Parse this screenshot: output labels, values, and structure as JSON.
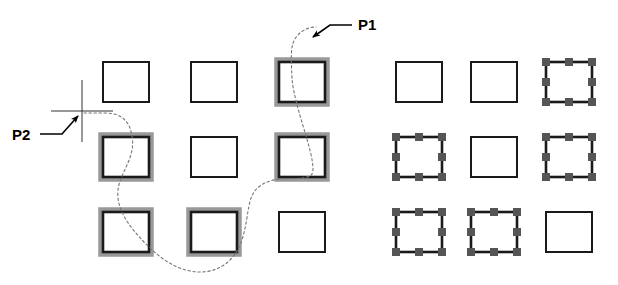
{
  "figure": {
    "background_color": "#ffffff",
    "width": 618,
    "height": 285
  },
  "colors": {
    "outline": "#1a1a1a",
    "highlight_halo": "#999999",
    "grip": "#555555",
    "lasso": "#777777",
    "crosshair": "#333333",
    "leader": "#000000",
    "label": "#000000"
  },
  "labels": [
    {
      "id": "p1",
      "text": "P1",
      "x": 358,
      "y": 30,
      "description": "end point of free-form selection path"
    },
    {
      "id": "p2",
      "text": "P2",
      "x": 12,
      "y": 140,
      "description": "start point of free-form selection path at crosshair cursor"
    }
  ],
  "geometry": {
    "square_width": 46,
    "square_height": 40,
    "left_group": {
      "name": "before-selection",
      "origin_x": 103,
      "origin_y": 62,
      "col_step": 88,
      "row_step": 75
    },
    "right_group": {
      "name": "after-selection",
      "origin_x": 396,
      "origin_y": 62,
      "col_step": 75,
      "row_step": 75
    },
    "crosshair": {
      "center_x": 82,
      "center_y": 111,
      "h_length": 62,
      "v_length": 62
    },
    "lasso_path": "M 84 113 L 105 113 C 122 113 130 122 132 136 C 136 158 120 172 118 190 C 116 210 130 228 148 246 C 162 260 180 272 200 272 C 222 272 236 258 242 240 C 250 214 246 196 260 186 C 276 174 296 182 310 176 C 322 170 294 110 292 78 C 291 56 290 44 297 36 C 303 29 310 27 316 27",
    "p1_leader": "M 352 25 L 330 25 L 313 37",
    "p2_leader": "M 40 134 L 62 134 L 78 116"
  },
  "left_group_squares": [
    {
      "row": 0,
      "col": 0,
      "state": "normal"
    },
    {
      "row": 0,
      "col": 1,
      "state": "normal"
    },
    {
      "row": 0,
      "col": 2,
      "state": "highlighted"
    },
    {
      "row": 1,
      "col": 0,
      "state": "highlighted"
    },
    {
      "row": 1,
      "col": 1,
      "state": "normal"
    },
    {
      "row": 1,
      "col": 2,
      "state": "highlighted"
    },
    {
      "row": 2,
      "col": 0,
      "state": "highlighted"
    },
    {
      "row": 2,
      "col": 1,
      "state": "highlighted"
    },
    {
      "row": 2,
      "col": 2,
      "state": "normal"
    }
  ],
  "right_group_squares": [
    {
      "row": 0,
      "col": 0,
      "state": "normal"
    },
    {
      "row": 0,
      "col": 1,
      "state": "normal"
    },
    {
      "row": 0,
      "col": 2,
      "state": "gripped"
    },
    {
      "row": 1,
      "col": 0,
      "state": "gripped"
    },
    {
      "row": 1,
      "col": 1,
      "state": "normal"
    },
    {
      "row": 1,
      "col": 2,
      "state": "gripped"
    },
    {
      "row": 2,
      "col": 0,
      "state": "gripped"
    },
    {
      "row": 2,
      "col": 1,
      "state": "gripped"
    },
    {
      "row": 2,
      "col": 2,
      "state": "normal"
    }
  ]
}
